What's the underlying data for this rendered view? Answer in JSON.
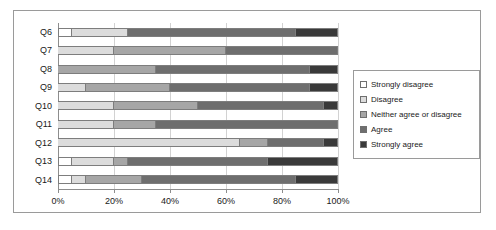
{
  "chart_data": {
    "type": "bar",
    "orientation": "horizontal",
    "stacked": true,
    "stack_mode": "percent",
    "title": "",
    "subtitle": "",
    "xlabel": "",
    "ylabel": "",
    "xlim": [
      0,
      100
    ],
    "grid": true,
    "legend_position": "right",
    "x_tick_labels": [
      "0%",
      "20%",
      "40%",
      "60%",
      "80%",
      "100%"
    ],
    "x_tick_values": [
      0,
      20,
      40,
      60,
      80,
      100
    ],
    "categories": [
      "Q6",
      "Q7",
      "Q8",
      "Q9",
      "Q10",
      "Q11",
      "Q12",
      "Q13",
      "Q14"
    ],
    "series": [
      {
        "name": "Strongly disagree",
        "color": "#ffffff",
        "values": [
          5,
          0,
          0,
          0,
          0,
          0,
          0,
          5,
          5
        ]
      },
      {
        "name": "Disagree",
        "color": "#dcdcdc",
        "values": [
          20,
          20,
          0,
          10,
          20,
          20,
          65,
          15,
          5
        ]
      },
      {
        "name": "Neither agree or disagree",
        "color": "#a6a6a6",
        "values": [
          0,
          40,
          35,
          30,
          30,
          15,
          10,
          5,
          20
        ]
      },
      {
        "name": "Agree",
        "color": "#6e6e6e",
        "values": [
          60,
          40,
          55,
          50,
          45,
          65,
          20,
          50,
          55
        ]
      },
      {
        "name": "Strongly agree",
        "color": "#3a3a3a",
        "values": [
          15,
          0,
          10,
          10,
          5,
          0,
          5,
          25,
          15
        ]
      }
    ]
  },
  "legend": {
    "items": [
      {
        "label": "Strongly disagree",
        "color": "#ffffff"
      },
      {
        "label": "Disagree",
        "color": "#dcdcdc"
      },
      {
        "label": "Neither agree or disagree",
        "color": "#a6a6a6"
      },
      {
        "label": "Agree",
        "color": "#6e6e6e"
      },
      {
        "label": "Strongly agree",
        "color": "#3a3a3a"
      }
    ]
  },
  "colors": {
    "frame_border": "#9a9a9a",
    "gridline": "#d2d2d2",
    "axis": "#8d8d8d",
    "segment_border": "#7d7d7d",
    "text": "#1a1a1a",
    "background": "#ffffff"
  }
}
